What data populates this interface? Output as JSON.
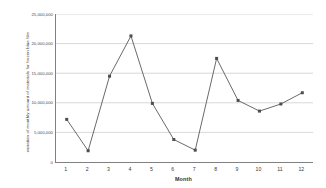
{
  "chart_data": {
    "type": "line",
    "title": "",
    "xlabel": "Month",
    "ylabel": "variation of monthly amount of materials for frozen blue film",
    "categories": [
      "1",
      "2",
      "3",
      "4",
      "5",
      "6",
      "7",
      "8",
      "9",
      "10",
      "11",
      "12"
    ],
    "x": [
      1,
      2,
      3,
      4,
      5,
      6,
      7,
      8,
      9,
      10,
      11,
      12
    ],
    "values": [
      7200000,
      1900000,
      14500000,
      21300000,
      9900000,
      3800000,
      2000000,
      17500000,
      10400000,
      8600000,
      9800000,
      11700000
    ],
    "series": [
      {
        "name": "variation of monthly amount of materials for frozen blue film",
        "values": [
          7200000,
          1900000,
          14500000,
          21300000,
          9900000,
          3800000,
          2000000,
          17500000,
          10400000,
          8600000,
          9800000,
          11700000
        ]
      }
    ],
    "ylim": [
      0,
      25000000
    ],
    "xlim": [
      0.5,
      12.5
    ],
    "yticks": [
      0,
      5000000,
      10000000,
      15000000,
      20000000,
      25000000
    ],
    "ytick_labels": [
      "0",
      "5,000,000",
      "10,000,000",
      "15,000,000",
      "20,000,000",
      "25,000,000"
    ],
    "xticks": [
      1,
      2,
      3,
      4,
      5,
      6,
      7,
      8,
      9,
      10,
      11,
      12
    ],
    "xtick_labels": [
      "1",
      "2",
      "3",
      "4",
      "5",
      "6",
      "7",
      "8",
      "9",
      "10",
      "11",
      "12"
    ],
    "grid": "horizontal",
    "legend": "none",
    "marker": "square",
    "line_color": "#595959",
    "marker_color": "#4d4d4d",
    "grid_color": "#c8c8c8",
    "axis_color": "#808080",
    "background": "#ffffff"
  }
}
